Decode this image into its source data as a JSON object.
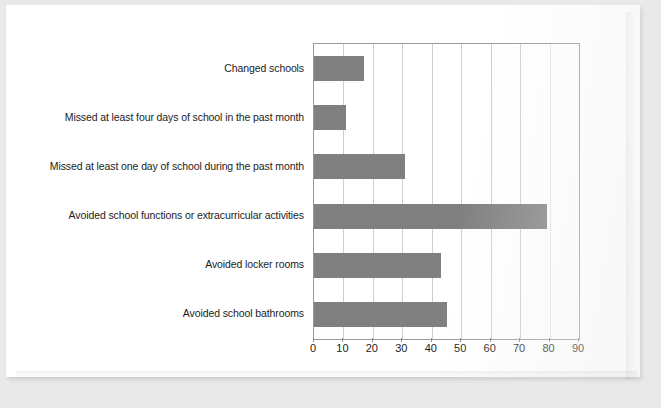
{
  "document": {
    "type": "scanned-page",
    "background_color": "#e9e9e9",
    "page_color": "#ffffff"
  },
  "chart_data": {
    "type": "bar",
    "orientation": "horizontal",
    "title": "",
    "subtitle": "",
    "xlabel": "",
    "ylabel": "",
    "categories": [
      "Changed schools",
      "Missed at least four days of school in the past month",
      "Missed at least one day of school during the past month",
      "Avoided school functions or extracurricular activities",
      "Avoided locker rooms",
      "Avoided school bathrooms"
    ],
    "values": [
      17,
      11,
      31,
      79,
      43,
      45
    ],
    "xlim": [
      0,
      90
    ],
    "xticks": [
      0,
      10,
      20,
      30,
      40,
      50,
      60,
      70,
      80,
      90
    ],
    "xtick_labels": [
      "0",
      "10",
      "20",
      "30",
      "40",
      "50",
      "60",
      "70",
      "80",
      "90"
    ],
    "grid": true,
    "grid_axis": "x",
    "legend": false,
    "legend_position": "none",
    "bar_color": "#808080",
    "plot_border_color": "#9a9a9a",
    "gridline_color": "#cfcfcf",
    "text_color": "#1c1c1c"
  }
}
